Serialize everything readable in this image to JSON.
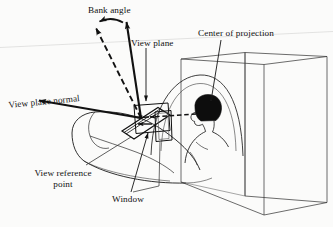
{
  "figure": {
    "domain": "technical-line-diagram",
    "width": 333,
    "height": 227,
    "background_color": "#fbfbfa",
    "ink_color": "#111111",
    "faint_scan_line_color": "#d8d8d6"
  },
  "labels": {
    "bank_angle": "Bank angle",
    "view_plane": "View plane",
    "center_of_projection": "Center of projection",
    "view_plane_normal": "View plane normal",
    "view_reference_point_line1": "View reference",
    "view_reference_point_line2": "point",
    "window": "Window"
  },
  "annotations": {
    "arrow_styles": {
      "view_up_vector": "solid-vertical-arrow",
      "bank_rotated_vector": "dashed-diagonal-arrow",
      "bank_arc": "curved-arc-arrow",
      "view_plane_normal": "solid-horizontal-arrow-left",
      "projector": "dashed-arrow-to-eye"
    },
    "scene_objects": [
      "room-box-wireframe",
      "aircraft-cockpit-fuselage",
      "canopy-arch",
      "pilot-head-and-shoulders",
      "view-plane-rectangle",
      "window-rectangle"
    ]
  }
}
